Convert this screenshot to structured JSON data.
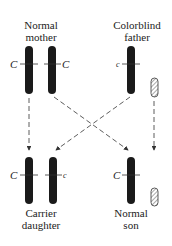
{
  "labels": {
    "mother": [
      "Normal",
      "mother"
    ],
    "father": [
      "Colorblind",
      "father"
    ],
    "daughter": [
      "Carrier",
      "daughter"
    ],
    "son": [
      "Normal",
      "son"
    ]
  },
  "alleles": {
    "mother_left": "C",
    "mother_right": "C",
    "father_x": "c",
    "daughter_left": "C",
    "daughter_right": "c",
    "son_x": "C"
  },
  "colors": {
    "chromosome": "#1a1a1a",
    "y_hatch": "#555555",
    "arrow": "#333333"
  }
}
